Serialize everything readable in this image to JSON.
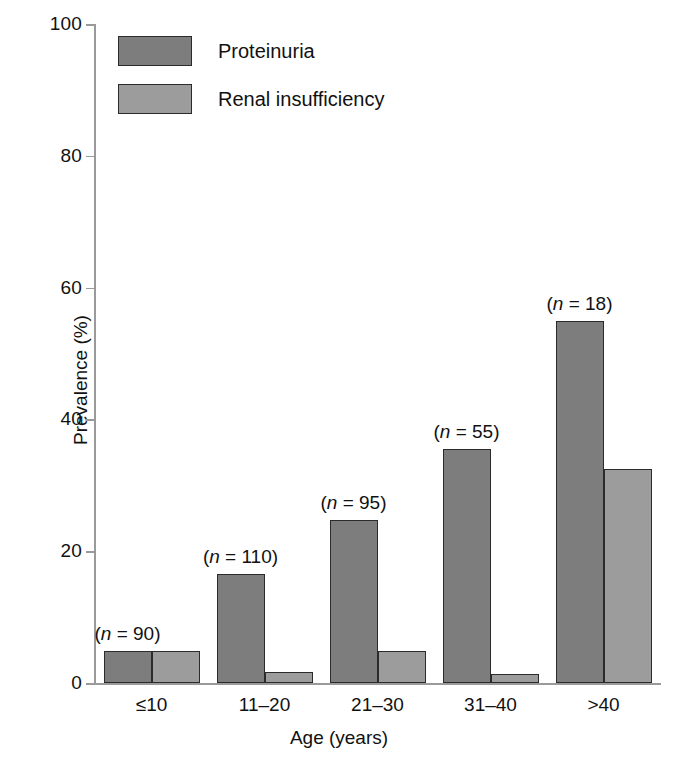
{
  "chart_data": {
    "type": "bar",
    "title": "",
    "xlabel": "Age (years)",
    "ylabel": "Prevalence (%)",
    "categories": [
      "≤10",
      "11–20",
      "21–30",
      "31–40",
      ">40"
    ],
    "ylim": [
      0,
      100
    ],
    "yticks": [
      0,
      20,
      40,
      60,
      80,
      100
    ],
    "ytick_labels": [
      "0",
      "20",
      "40",
      "60",
      "80",
      "100"
    ],
    "grid": false,
    "legend_position": "top-left",
    "series": [
      {
        "name": "Proteinuria",
        "color": "#7d7d7d",
        "values": [
          4.8,
          16.5,
          24.8,
          35.5,
          55.0
        ]
      },
      {
        "name": "Renal insufficiency",
        "color": "#9c9c9c",
        "values": [
          4.8,
          1.7,
          4.8,
          1.3,
          32.5
        ]
      }
    ],
    "annotations": [
      {
        "category": "≤10",
        "prefix": "(",
        "italic": "n",
        "eq": " = ",
        "value": "90",
        "suffix": ")",
        "text": "(n = 90)"
      },
      {
        "category": "11–20",
        "prefix": "(",
        "italic": "n",
        "eq": " = ",
        "value": "110",
        "suffix": ")",
        "text": "(n = 110)"
      },
      {
        "category": "21–30",
        "prefix": "(",
        "italic": "n",
        "eq": " = ",
        "value": "95",
        "suffix": ")",
        "text": "(n = 95)"
      },
      {
        "category": "31–40",
        "prefix": "(",
        "italic": "n",
        "eq": " = ",
        "value": "55",
        "suffix": ")",
        "text": "(n = 55)"
      },
      {
        "category": ">40",
        "prefix": "(",
        "italic": "n",
        "eq": " = ",
        "value": "18",
        "suffix": ")",
        "text": "(n = 18)"
      }
    ]
  }
}
